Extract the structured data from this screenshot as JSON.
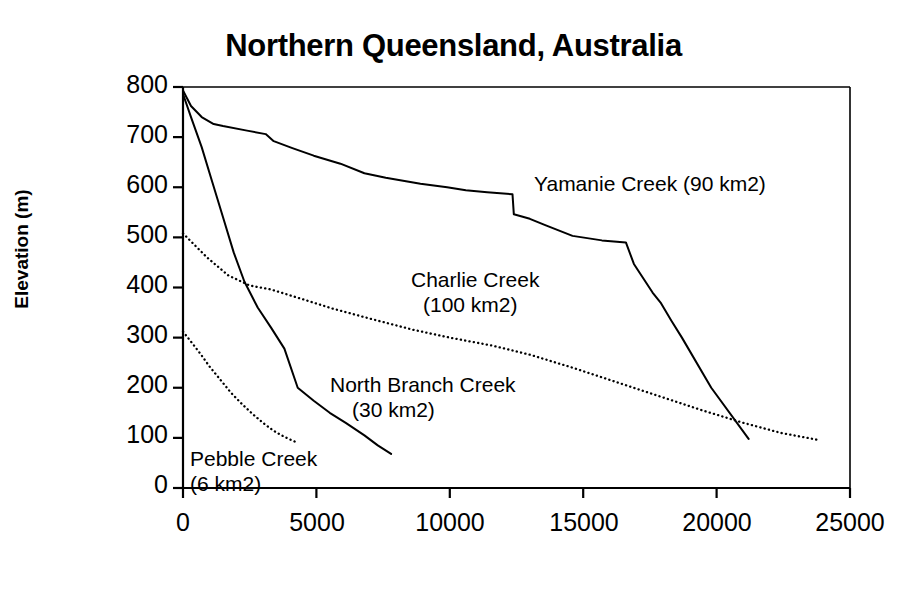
{
  "chart_data": {
    "type": "line",
    "title": "Northern Queensland, Australia",
    "xlabel": "",
    "ylabel": "Elevation (m)",
    "xlim": [
      0,
      25000
    ],
    "ylim": [
      0,
      800
    ],
    "grid": false,
    "legend_position": "inline-annotations",
    "xticks": [
      "0",
      "5000",
      "10000",
      "15000",
      "20000",
      "25000"
    ],
    "xtick_values": [
      0,
      5000,
      10000,
      15000,
      20000,
      25000
    ],
    "yticks": [
      "0",
      "100",
      "200",
      "300",
      "400",
      "500",
      "600",
      "700",
      "800"
    ],
    "ytick_values": [
      0,
      100,
      200,
      300,
      400,
      500,
      600,
      700,
      800
    ],
    "series": [
      {
        "name": "Yamanie Creek (90 km2)",
        "area_km2": 90,
        "style": "solid",
        "color": "#000000",
        "points": [
          [
            0,
            793
          ],
          [
            300,
            762
          ],
          [
            700,
            740
          ],
          [
            1150,
            726
          ],
          [
            1500,
            722
          ],
          [
            2400,
            713
          ],
          [
            3100,
            706
          ],
          [
            3400,
            692
          ],
          [
            4100,
            678
          ],
          [
            4900,
            663
          ],
          [
            5900,
            647
          ],
          [
            6800,
            628
          ],
          [
            7600,
            619
          ],
          [
            8900,
            607
          ],
          [
            9900,
            600
          ],
          [
            10600,
            594
          ],
          [
            11400,
            590
          ],
          [
            12350,
            586
          ],
          [
            12400,
            546
          ],
          [
            13000,
            537
          ],
          [
            13600,
            524
          ],
          [
            14600,
            503
          ],
          [
            15700,
            494
          ],
          [
            16600,
            490
          ],
          [
            16900,
            447
          ],
          [
            17600,
            390
          ],
          [
            17900,
            370
          ],
          [
            18300,
            334
          ],
          [
            18700,
            300
          ],
          [
            19800,
            200
          ],
          [
            21200,
            98
          ]
        ]
      },
      {
        "name": "North Branch Creek (30 km2)",
        "area_km2": 30,
        "style": "solid",
        "color": "#000000",
        "points": [
          [
            0,
            786
          ],
          [
            300,
            740
          ],
          [
            700,
            680
          ],
          [
            1100,
            610
          ],
          [
            1500,
            540
          ],
          [
            1900,
            470
          ],
          [
            2300,
            412
          ],
          [
            2800,
            360
          ],
          [
            3300,
            320
          ],
          [
            3800,
            278
          ],
          [
            4300,
            200
          ],
          [
            4900,
            174
          ],
          [
            5500,
            150
          ],
          [
            6100,
            130
          ],
          [
            6800,
            105
          ],
          [
            7300,
            85
          ],
          [
            7800,
            68
          ]
        ]
      },
      {
        "name": "Charlie Creek (100 km2)",
        "area_km2": 100,
        "style": "dotted",
        "color": "#000000",
        "points": [
          [
            0,
            508
          ],
          [
            900,
            460
          ],
          [
            1700,
            424
          ],
          [
            2500,
            404
          ],
          [
            3300,
            396
          ],
          [
            4400,
            378
          ],
          [
            5600,
            358
          ],
          [
            7000,
            338
          ],
          [
            8600,
            316
          ],
          [
            10000,
            300
          ],
          [
            11600,
            284
          ],
          [
            13000,
            266
          ],
          [
            14600,
            240
          ],
          [
            16200,
            212
          ],
          [
            17800,
            184
          ],
          [
            19400,
            156
          ],
          [
            21000,
            130
          ],
          [
            22400,
            110
          ],
          [
            23800,
            96
          ]
        ]
      },
      {
        "name": "Pebble Creek (6 km2)",
        "area_km2": 6,
        "style": "dotted",
        "color": "#000000",
        "points": [
          [
            0,
            312
          ],
          [
            300,
            292
          ],
          [
            650,
            268
          ],
          [
            1000,
            242
          ],
          [
            1400,
            216
          ],
          [
            1800,
            190
          ],
          [
            2200,
            168
          ],
          [
            2600,
            148
          ],
          [
            3000,
            130
          ],
          [
            3400,
            114
          ],
          [
            3800,
            102
          ],
          [
            4300,
            90
          ]
        ]
      }
    ],
    "annotations": [
      {
        "id": "yamanie-label",
        "lines": [
          "Yamanie Creek (90 km2)"
        ],
        "x": 15000,
        "y": 612
      },
      {
        "id": "charlie-label",
        "lines": [
          "Charlie Creek",
          "(100 km2)"
        ],
        "x": 11000,
        "y": 430
      },
      {
        "id": "north-branch-label",
        "lines": [
          "North Branch Creek",
          "(30 km2)"
        ],
        "x": 8300,
        "y": 222
      },
      {
        "id": "pebble-label",
        "lines": [
          "Pebble Creek",
          "(6 km2)"
        ],
        "x": 1300,
        "y": 78
      }
    ]
  },
  "axis_labels": {
    "y_title": "Elevation (m)",
    "y_800": "800",
    "y_700": "700",
    "y_600": "600",
    "y_500": "500",
    "y_400": "400",
    "y_300": "300",
    "y_200": "200",
    "y_100": "100",
    "y_0": "0",
    "x_0": "0",
    "x_5000": "5000",
    "x_10000": "10000",
    "x_15000": "15000",
    "x_20000": "20000",
    "x_25000": "25000"
  },
  "labels": {
    "title": "Northern Queensland, Australia",
    "yamanie": "Yamanie Creek (90 km2)",
    "charlie_line1": "Charlie Creek",
    "charlie_line2": "(100 km2)",
    "north_branch_line1": "North Branch Creek",
    "north_branch_line2": "(30 km2)",
    "pebble_line1": "Pebble Creek",
    "pebble_line2": "(6 km2)"
  },
  "colors": {
    "ink": "#000000",
    "background": "#ffffff"
  }
}
